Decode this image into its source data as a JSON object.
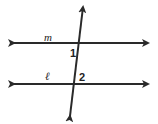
{
  "diagram": {
    "lines": [
      {
        "name": "m",
        "label": "m"
      },
      {
        "name": "l",
        "label": "ℓ"
      }
    ],
    "angles": [
      {
        "label": "1"
      },
      {
        "label": "2"
      }
    ],
    "color": "#2a2a2a"
  }
}
